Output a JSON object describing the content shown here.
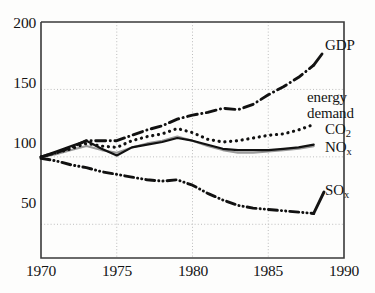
{
  "chart_data": {
    "type": "line",
    "title": "",
    "subtitle": "",
    "xlabel": "",
    "ylabel": "",
    "xlim": [
      1970,
      1990
    ],
    "ylim": [
      25,
      200
    ],
    "y_axis_ticks": [
      "200",
      "150",
      "100",
      "50"
    ],
    "y_axis_tick_values": [
      200,
      150,
      100,
      50
    ],
    "x_axis_ticks": [
      "1970",
      "1975",
      "1980",
      "1985",
      "1990"
    ],
    "x_axis_tick_values": [
      1970,
      1975,
      1980,
      1985,
      1990
    ],
    "grid": "dotted gridlines at each labelled tick",
    "legend_position": "inline right of each series end",
    "index_note": "index values, 1970 = 100",
    "series": [
      {
        "name": "GDP",
        "label": "GDP",
        "linestyle": "dash-dot",
        "color": "#111111",
        "x": [
          1970,
          1971,
          1972,
          1973,
          1974,
          1975,
          1976,
          1977,
          1978,
          1979,
          1980,
          1981,
          1982,
          1983,
          1984,
          1985,
          1986,
          1987,
          1988
        ],
        "values": [
          100,
          103,
          107,
          112,
          112,
          112,
          116,
          120,
          123,
          128,
          131,
          133,
          136,
          135,
          139,
          146,
          152,
          159,
          168
        ]
      },
      {
        "name": "energy demand",
        "label": "energy demand",
        "linestyle": "dotted",
        "color": "#111111",
        "x": [
          1970,
          1971,
          1972,
          1973,
          1974,
          1975,
          1976,
          1977,
          1978,
          1979,
          1980,
          1981,
          1982,
          1983,
          1984,
          1985,
          1986,
          1987,
          1988
        ],
        "values": [
          100,
          103,
          106,
          110,
          108,
          107,
          112,
          115,
          117,
          121,
          118,
          113,
          111,
          112,
          114,
          116,
          117,
          120,
          124
        ]
      },
      {
        "name": "CO2",
        "label": "CO₂",
        "linestyle": "solid",
        "color": "#111111",
        "x": [
          1970,
          1971,
          1972,
          1973,
          1974,
          1975,
          1976,
          1977,
          1978,
          1979,
          1980,
          1981,
          1982,
          1983,
          1984,
          1985,
          1986,
          1987,
          1988
        ],
        "values": [
          100,
          104,
          108,
          112,
          106,
          101,
          107,
          109,
          111,
          114,
          112,
          109,
          106,
          105,
          105,
          105,
          106,
          107,
          109
        ]
      },
      {
        "name": "NOx",
        "label": "NOₓ",
        "linestyle": "solid-grey",
        "color": "#9a9a9a",
        "x": [
          1970,
          1971,
          1972,
          1973,
          1974,
          1975,
          1976,
          1977,
          1978,
          1979,
          1980,
          1981,
          1982,
          1983,
          1984,
          1985,
          1986,
          1987,
          1988
        ],
        "values": [
          100,
          102,
          105,
          108,
          105,
          103,
          107,
          110,
          112,
          115,
          112,
          108,
          105,
          103,
          103,
          104,
          105,
          106,
          108
        ]
      },
      {
        "name": "SOx",
        "label": "SOₓ",
        "linestyle": "dash-dot-dot",
        "color": "#111111",
        "x": [
          1970,
          1971,
          1972,
          1973,
          1974,
          1975,
          1976,
          1977,
          1978,
          1979,
          1980,
          1981,
          1982,
          1983,
          1984,
          1985,
          1986,
          1987,
          1988
        ],
        "values": [
          99,
          97,
          94,
          92,
          89,
          87,
          85,
          83,
          82,
          83,
          79,
          73,
          68,
          64,
          62,
          61,
          60,
          59,
          58
        ]
      }
    ]
  },
  "labels": {
    "gdp": "GDP",
    "energy_line1": "energy",
    "energy_line2": "demand",
    "co2_main": "CO",
    "co2_sub": "2",
    "nox_main": "NO",
    "nox_sub": "x",
    "sox_main": "SO",
    "sox_sub": "x"
  },
  "colors": {
    "ink": "#111111",
    "grid": "#b8b8b8",
    "axis": "#2a2a2a",
    "nox_grey": "#9a9a9a",
    "background": "#fdfdfc"
  }
}
